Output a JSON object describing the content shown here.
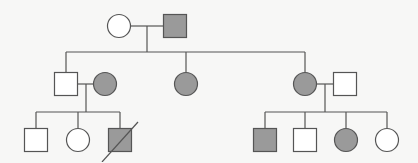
{
  "diagram": {
    "type": "pedigree",
    "colors": {
      "affected": "#9a9a9a",
      "unaffected": "#ffffff",
      "stroke": "#555555",
      "background": "#f7f7f6"
    },
    "individuals": [
      {
        "id": "I-1",
        "sex": "female",
        "affected": false,
        "deceased": false,
        "x": 119,
        "y": 26
      },
      {
        "id": "I-2",
        "sex": "male",
        "affected": true,
        "deceased": false,
        "x": 175,
        "y": 26
      },
      {
        "id": "II-1",
        "sex": "male",
        "affected": false,
        "deceased": false,
        "x": 66,
        "y": 84
      },
      {
        "id": "II-2",
        "sex": "female",
        "affected": true,
        "deceased": false,
        "x": 105,
        "y": 84
      },
      {
        "id": "II-3",
        "sex": "female",
        "affected": true,
        "deceased": false,
        "x": 186,
        "y": 84
      },
      {
        "id": "II-4",
        "sex": "female",
        "affected": true,
        "deceased": false,
        "x": 305,
        "y": 84
      },
      {
        "id": "II-5",
        "sex": "male",
        "affected": false,
        "deceased": false,
        "x": 345,
        "y": 84
      },
      {
        "id": "III-1",
        "sex": "male",
        "affected": false,
        "deceased": false,
        "x": 36,
        "y": 140
      },
      {
        "id": "III-2",
        "sex": "female",
        "affected": false,
        "deceased": false,
        "x": 78,
        "y": 140
      },
      {
        "id": "III-3",
        "sex": "male",
        "affected": true,
        "deceased": true,
        "x": 120,
        "y": 140
      },
      {
        "id": "III-4",
        "sex": "male",
        "affected": true,
        "deceased": false,
        "x": 265,
        "y": 140
      },
      {
        "id": "III-5",
        "sex": "male",
        "affected": false,
        "deceased": false,
        "x": 305,
        "y": 140
      },
      {
        "id": "III-6",
        "sex": "female",
        "affected": true,
        "deceased": false,
        "x": 346,
        "y": 140
      },
      {
        "id": "III-7",
        "sex": "female",
        "affected": false,
        "deceased": false,
        "x": 387,
        "y": 140
      }
    ],
    "lines": [
      {
        "name": "mating-line-I",
        "x1": 131,
        "y1": 26,
        "x2": 163,
        "y2": 26
      },
      {
        "name": "descent-line-I",
        "x1": 147,
        "y1": 26,
        "x2": 147,
        "y2": 52
      },
      {
        "name": "sibship-line-II",
        "x1": 66,
        "y1": 52,
        "x2": 305,
        "y2": 52
      },
      {
        "name": "drop-II-1",
        "x1": 66,
        "y1": 52,
        "x2": 66,
        "y2": 72
      },
      {
        "name": "drop-II-3",
        "x1": 186,
        "y1": 52,
        "x2": 186,
        "y2": 72
      },
      {
        "name": "drop-II-4",
        "x1": 305,
        "y1": 52,
        "x2": 305,
        "y2": 72
      },
      {
        "name": "mating-line-II-left",
        "x1": 78,
        "y1": 84,
        "x2": 93,
        "y2": 84
      },
      {
        "name": "descent-line-II-left",
        "x1": 86,
        "y1": 84,
        "x2": 86,
        "y2": 112
      },
      {
        "name": "sibship-line-III-left",
        "x1": 36,
        "y1": 112,
        "x2": 120,
        "y2": 112
      },
      {
        "name": "drop-III-1",
        "x1": 36,
        "y1": 112,
        "x2": 36,
        "y2": 128
      },
      {
        "name": "drop-III-2",
        "x1": 78,
        "y1": 112,
        "x2": 78,
        "y2": 128
      },
      {
        "name": "drop-III-3",
        "x1": 120,
        "y1": 112,
        "x2": 120,
        "y2": 128
      },
      {
        "name": "mating-line-II-right",
        "x1": 317,
        "y1": 84,
        "x2": 333,
        "y2": 84
      },
      {
        "name": "descent-line-II-right",
        "x1": 325,
        "y1": 84,
        "x2": 325,
        "y2": 112
      },
      {
        "name": "sibship-line-III-right",
        "x1": 265,
        "y1": 112,
        "x2": 387,
        "y2": 112
      },
      {
        "name": "drop-III-4",
        "x1": 265,
        "y1": 112,
        "x2": 265,
        "y2": 128
      },
      {
        "name": "drop-III-5",
        "x1": 305,
        "y1": 112,
        "x2": 305,
        "y2": 128
      },
      {
        "name": "drop-III-6",
        "x1": 346,
        "y1": 112,
        "x2": 346,
        "y2": 128
      },
      {
        "name": "drop-III-7",
        "x1": 387,
        "y1": 112,
        "x2": 387,
        "y2": 128
      }
    ],
    "symbol_size": 23,
    "deceased_slash_extent": 18
  }
}
